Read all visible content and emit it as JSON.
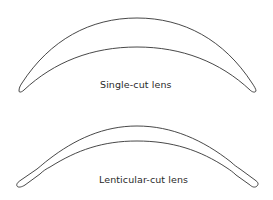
{
  "diagram": {
    "items": [
      {
        "label": "Single-cut lens"
      },
      {
        "label": "Lenticular-cut lens"
      }
    ],
    "stroke_color": "#333333",
    "background": "#ffffff"
  }
}
